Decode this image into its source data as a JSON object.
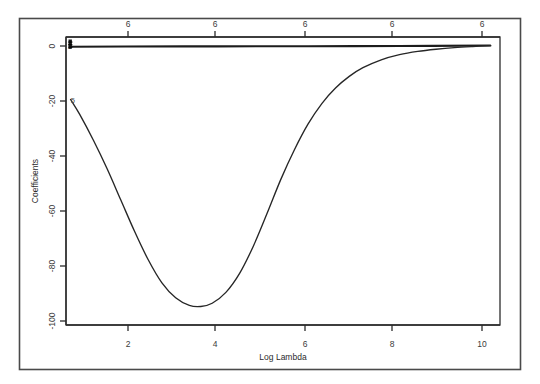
{
  "chart_data": {
    "type": "line",
    "title": "",
    "subtitle": "",
    "xlabel": "Log Lambda",
    "ylabel": "Coefficients",
    "top_axis_label": "",
    "xlim": [
      0.7,
      10.2
    ],
    "ylim": [
      -103,
      3
    ],
    "grid": false,
    "legend": "none",
    "legend_position": "none",
    "x_ticks": [
      2,
      4,
      6,
      8,
      10
    ],
    "x_tick_labels": [
      "2",
      "4",
      "6",
      "8",
      "10"
    ],
    "y_ticks": [
      0,
      -20,
      -40,
      -60,
      -80,
      -100
    ],
    "y_tick_labels": [
      "0",
      "-20",
      "-40",
      "-60",
      "-80",
      "-100"
    ],
    "top_ticks": [
      2,
      4,
      6,
      8,
      10
    ],
    "top_tick_labels": [
      "6",
      "6",
      "6",
      "6",
      "6"
    ],
    "annotations": [
      {
        "text": "5",
        "x": 0.85,
        "y": -20.5,
        "name": "curve-5-label"
      },
      {
        "text": "1",
        "x": 0.78,
        "y": -0.4,
        "name": "coef-cluster-label"
      }
    ],
    "series": [
      {
        "name": "coefficient-5",
        "color": "#262626",
        "x": [
          0.8,
          1.0,
          1.3,
          1.6,
          1.9,
          2.2,
          2.5,
          2.8,
          3.1,
          3.4,
          3.65,
          3.9,
          4.2,
          4.5,
          4.8,
          5.1,
          5.4,
          5.7,
          6.0,
          6.3,
          6.6,
          6.9,
          7.2,
          7.6,
          8.0,
          8.4,
          8.8,
          9.2,
          9.6,
          10.0
        ],
        "values": [
          -20.0,
          -25.5,
          -35.0,
          -45.5,
          -57.0,
          -68.5,
          -79.0,
          -87.5,
          -93.0,
          -95.8,
          -96.2,
          -95.0,
          -91.0,
          -84.0,
          -74.0,
          -62.0,
          -49.5,
          -38.5,
          -29.0,
          -21.5,
          -15.8,
          -11.5,
          -8.3,
          -5.4,
          -3.5,
          -2.3,
          -1.5,
          -0.9,
          -0.5,
          -0.2
        ]
      },
      {
        "name": "coefficients-flat-group",
        "color": "#1c1c1c",
        "x": [
          0.8,
          2.0,
          4.0,
          6.0,
          8.0,
          10.0
        ],
        "values": [
          -0.6,
          -0.5,
          -0.45,
          -0.4,
          -0.3,
          -0.15
        ]
      }
    ]
  },
  "figure": {
    "background_color": "#ffffff",
    "frame_color": "#4a4a4a",
    "axis_color": "#2b2b2b",
    "series_color": "#262626"
  }
}
